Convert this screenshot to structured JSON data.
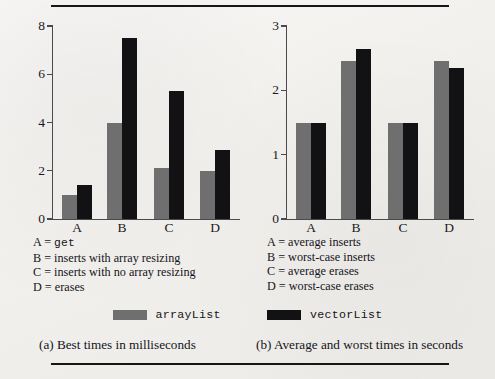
{
  "figure": {
    "rule_top": "horizontal-rule",
    "rule_bottom": "horizontal-rule"
  },
  "legend": {
    "series": [
      {
        "key": "arrayList",
        "label": "arrayList",
        "color": "#6f6f6f",
        "swatch": "gray-swatch"
      },
      {
        "key": "vectorList",
        "label": "vectorList",
        "color": "#121214",
        "swatch": "black-swatch"
      }
    ]
  },
  "captions": {
    "a": "(a) Best times in milliseconds",
    "b": "(b) Average and worst times in seconds"
  },
  "keys": {
    "left": [
      {
        "letter": "A",
        "eq": " = ",
        "text": "get",
        "mono": true
      },
      {
        "letter": "B",
        "eq": " = ",
        "text": "inserts with array resizing",
        "mono": false
      },
      {
        "letter": "C",
        "eq": " = ",
        "text": "inserts with no array resizing",
        "mono": false
      },
      {
        "letter": "D",
        "eq": " = ",
        "text": "erases",
        "mono": false
      }
    ],
    "right": [
      {
        "letter": "A",
        "eq": " = ",
        "text": "average inserts",
        "mono": false
      },
      {
        "letter": "B",
        "eq": " = ",
        "text": "worst-case inserts",
        "mono": false
      },
      {
        "letter": "C",
        "eq": " = ",
        "text": "average erases",
        "mono": false
      },
      {
        "letter": "D",
        "eq": " = ",
        "text": "worst-case erases",
        "mono": false
      }
    ]
  },
  "chart_data": [
    {
      "id": "chart-a",
      "type": "bar",
      "title": "(a) Best times in milliseconds",
      "xlabel": "",
      "ylabel": "",
      "ylim": [
        0,
        8
      ],
      "yticks": [
        0,
        2,
        4,
        6,
        8
      ],
      "grid": false,
      "legend_position": "below-figure",
      "categories": [
        "A",
        "B",
        "C",
        "D"
      ],
      "series": [
        {
          "name": "arrayList",
          "color": "#6f6f6f",
          "values": [
            1.0,
            4.0,
            2.1,
            2.0
          ]
        },
        {
          "name": "vectorList",
          "color": "#121214",
          "values": [
            1.4,
            7.5,
            5.3,
            2.85
          ]
        }
      ]
    },
    {
      "id": "chart-b",
      "type": "bar",
      "title": "(b) Average and worst times in seconds",
      "xlabel": "",
      "ylabel": "",
      "ylim": [
        0,
        3
      ],
      "yticks": [
        0,
        1,
        2,
        3
      ],
      "grid": false,
      "legend_position": "below-figure",
      "categories": [
        "A",
        "B",
        "C",
        "D"
      ],
      "series": [
        {
          "name": "arrayList",
          "color": "#6f6f6f",
          "values": [
            1.5,
            2.45,
            1.5,
            2.45
          ]
        },
        {
          "name": "vectorList",
          "color": "#121214",
          "values": [
            1.5,
            2.65,
            1.5,
            2.35
          ]
        }
      ]
    }
  ]
}
